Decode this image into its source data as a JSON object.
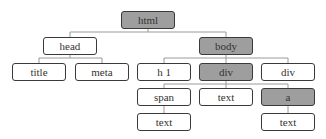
{
  "diagram": {
    "type": "dom-tree",
    "colors": {
      "highlight_fill": "#9e9e9e",
      "normal_fill": "#ffffff",
      "border": "#3a3a3a",
      "edge": "#9a9a9a",
      "text": "#333333"
    },
    "nodes": [
      {
        "id": "html",
        "label": "html",
        "highlighted": true,
        "parent": null
      },
      {
        "id": "head",
        "label": "head",
        "highlighted": false,
        "parent": "html"
      },
      {
        "id": "body",
        "label": "body",
        "highlighted": true,
        "parent": "html"
      },
      {
        "id": "title",
        "label": "title",
        "highlighted": false,
        "parent": "head"
      },
      {
        "id": "meta",
        "label": "meta",
        "highlighted": false,
        "parent": "head"
      },
      {
        "id": "h1",
        "label": "h 1",
        "highlighted": false,
        "parent": "body"
      },
      {
        "id": "div1",
        "label": "div",
        "highlighted": true,
        "parent": "body"
      },
      {
        "id": "div2",
        "label": "div",
        "highlighted": false,
        "parent": "body"
      },
      {
        "id": "span",
        "label": "span",
        "highlighted": false,
        "parent": "div1"
      },
      {
        "id": "text1",
        "label": "text",
        "highlighted": false,
        "parent": "div1"
      },
      {
        "id": "a",
        "label": "a",
        "highlighted": true,
        "parent": "div1"
      },
      {
        "id": "text2",
        "label": "text",
        "highlighted": false,
        "parent": "span"
      },
      {
        "id": "text3",
        "label": "text",
        "highlighted": false,
        "parent": "a"
      }
    ],
    "caption": ""
  }
}
